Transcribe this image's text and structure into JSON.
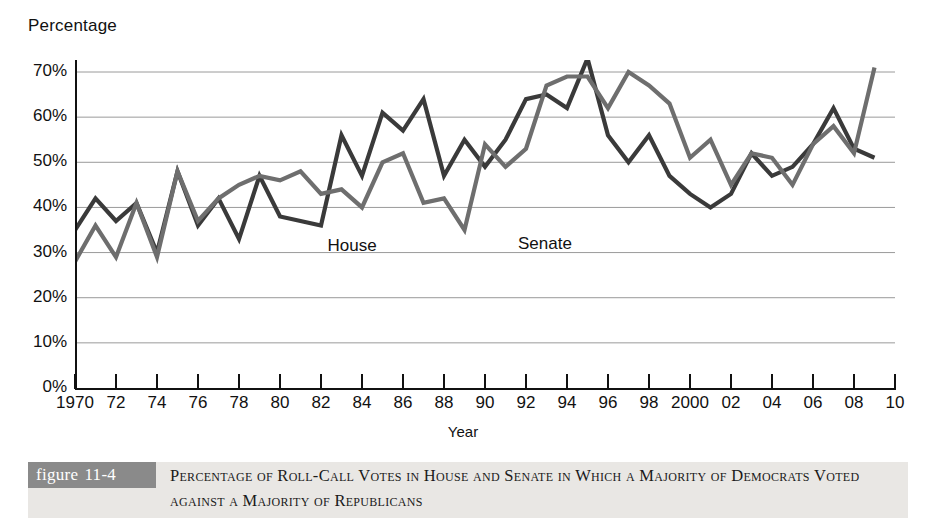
{
  "figure": {
    "badge_label": "figure",
    "badge_number": "11-4",
    "caption": "Percentage of Roll-Call Votes in House and Senate in Which a Majority of Democrats Voted against a Majority of Republicans"
  },
  "axes": {
    "y_title": "Percentage",
    "x_title": "Year",
    "y_tick_labels": [
      "70%",
      "60%",
      "50%",
      "40%",
      "30%",
      "20%",
      "10%",
      "0%"
    ],
    "x_tick_labels": [
      "1970",
      "72",
      "74",
      "76",
      "78",
      "80",
      "82",
      "84",
      "86",
      "88",
      "90",
      "92",
      "94",
      "96",
      "98",
      "2000",
      "02",
      "04",
      "06",
      "08",
      "10"
    ]
  },
  "series_labels": {
    "house": "House",
    "senate": "Senate"
  },
  "colors": {
    "house_line": "#3a3a3a",
    "senate_line": "#6e6e6e",
    "gridline": "#9a9a9a",
    "axis": "#111111",
    "badge_bg": "#8a8a8a",
    "caption_bg": "#e9e7e4"
  },
  "chart_data": {
    "type": "line",
    "title": "Percentage of Roll-Call Votes in House and Senate in Which a Majority of Democrats Voted against a Majority of Republicans",
    "xlabel": "Year",
    "ylabel": "Percentage",
    "xlim": [
      1970,
      2010
    ],
    "ylim": [
      0,
      75
    ],
    "y_ticks": [
      0,
      10,
      20,
      30,
      40,
      50,
      60,
      70
    ],
    "x_ticks": [
      1970,
      1972,
      1974,
      1976,
      1978,
      1980,
      1982,
      1984,
      1986,
      1988,
      1990,
      1992,
      1994,
      1996,
      1998,
      2000,
      2002,
      2004,
      2006,
      2008,
      2010
    ],
    "grid": "horizontal",
    "legend": "inline-annotations",
    "x": [
      1970,
      1971,
      1972,
      1973,
      1974,
      1975,
      1976,
      1977,
      1978,
      1979,
      1980,
      1981,
      1982,
      1983,
      1984,
      1985,
      1986,
      1987,
      1988,
      1989,
      1990,
      1991,
      1992,
      1993,
      1994,
      1995,
      1996,
      1997,
      1998,
      1999,
      2000,
      2001,
      2002,
      2003,
      2004,
      2005,
      2006,
      2007,
      2008,
      2009
    ],
    "series": [
      {
        "name": "House",
        "color": "#3a3a3a",
        "values": [
          35,
          42,
          37,
          41,
          30,
          48,
          36,
          42,
          33,
          47,
          38,
          37,
          36,
          56,
          47,
          61,
          57,
          64,
          47,
          55,
          49,
          55,
          64,
          65,
          62,
          73,
          56,
          50,
          56,
          47,
          43,
          40,
          43,
          52,
          47,
          49,
          54,
          62,
          53,
          51
        ],
        "label_x": 1983,
        "label_y": 31
      },
      {
        "name": "Senate",
        "color": "#6e6e6e",
        "values": [
          28,
          36,
          29,
          41,
          29,
          48,
          37,
          42,
          45,
          47,
          46,
          48,
          43,
          44,
          40,
          50,
          52,
          41,
          42,
          35,
          54,
          49,
          53,
          67,
          69,
          69,
          62,
          70,
          67,
          63,
          51,
          55,
          45,
          52,
          51,
          45,
          54,
          58,
          52,
          71
        ],
        "label_x": 1992,
        "label_y": 31
      }
    ]
  }
}
